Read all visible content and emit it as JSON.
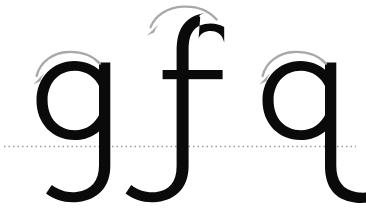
{
  "worksheet": {
    "title": "Lowercase letter formation practice",
    "description": "Three lowercase letters with descenders shown with stroke-direction arrows and a dotted baseline.",
    "background_color": "#ffffff",
    "letter_color": "#0a0a0a",
    "arrow_color": "#a8a8a8",
    "baseline_color": "#9a9a9a"
  },
  "baseline": {
    "label": "baseline",
    "style": "dotted",
    "y": 146,
    "x_start": 4,
    "x_end": 356,
    "color": "#9a9a9a",
    "thickness": 1.4,
    "dash": "1.5 3"
  },
  "letters": [
    {
      "id": "letter-g",
      "character": "g",
      "name": "lowercase-g",
      "order": 1,
      "x_center": 72,
      "has_descender": true,
      "descender_direction": "left",
      "arrow": {
        "name": "stroke-direction-arrow-g",
        "direction": "counter-clockwise",
        "points": "left",
        "color": "#a8a8a8"
      }
    },
    {
      "id": "letter-f",
      "character": "f",
      "name": "lowercase-f",
      "order": 2,
      "x_center": 186,
      "has_descender": true,
      "descender_direction": "left",
      "has_crossbar": true,
      "arrow": {
        "name": "stroke-direction-arrow-f",
        "direction": "counter-clockwise",
        "points": "left",
        "color": "#a8a8a8"
      }
    },
    {
      "id": "letter-q",
      "character": "q",
      "name": "lowercase-q",
      "order": 3,
      "x_center": 300,
      "has_descender": true,
      "descender_direction": "right",
      "arrow": {
        "name": "stroke-direction-arrow-q",
        "direction": "counter-clockwise",
        "points": "left",
        "color": "#a8a8a8"
      }
    }
  ]
}
